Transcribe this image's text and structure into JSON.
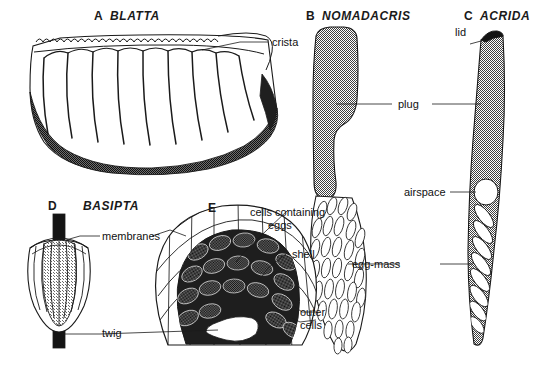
{
  "figure": {
    "type": "scientific-illustration-plate",
    "background_color": "#ffffff",
    "ink_color": "#1a1a1a",
    "fill_gray": "#8a8a8a",
    "dark_fill": "#3a3a3a"
  },
  "specimens": [
    {
      "letter": "A",
      "genus": "BLATTA",
      "position": "top-left",
      "labels": [
        "crista"
      ]
    },
    {
      "letter": "B",
      "genus": "NOMADACRIS",
      "position": "top-center",
      "labels": [
        "plug",
        "egg-mass"
      ]
    },
    {
      "letter": "C",
      "genus": "ACRIDA",
      "position": "top-right",
      "labels": [
        "lid",
        "plug",
        "airspace",
        "egg-mass"
      ]
    },
    {
      "letter": "D",
      "genus": "BASIPTA",
      "position": "bottom-left",
      "labels": [
        "membranes",
        "twig"
      ]
    },
    {
      "letter": "E",
      "genus": "",
      "position": "bottom-center",
      "labels": [
        "cells containing eggs",
        "shell",
        "outer cells",
        "twig"
      ]
    }
  ],
  "captions": {
    "a_letter": "A",
    "a_genus": "BLATTA",
    "b_letter": "B",
    "b_genus": "NOMADACRIS",
    "c_letter": "C",
    "c_genus": "ACRIDA",
    "d_letter": "D",
    "d_genus": "BASIPTA",
    "e_letter": "E"
  },
  "annotations": {
    "crista": "crista",
    "plug": "plug",
    "lid": "lid",
    "airspace": "airspace",
    "egg_mass": "egg-mass",
    "membranes": "membranes",
    "twig": "twig",
    "cells_containing_eggs_line1": "cells containing",
    "cells_containing_eggs_line2": "eggs",
    "shell": "shell",
    "outer_cells_line1": "outer",
    "outer_cells_line2": "cells"
  }
}
